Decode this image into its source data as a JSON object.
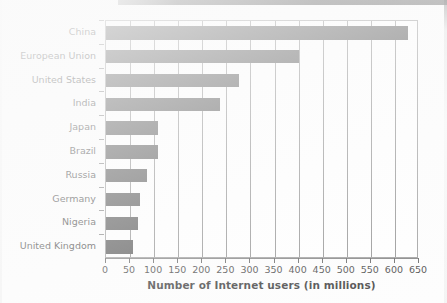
{
  "chart_data": {
    "type": "bar",
    "orientation": "horizontal",
    "title": "",
    "xlabel": "Number of Internet users (in millions)",
    "ylabel": "",
    "xlim": [
      0,
      650
    ],
    "xticks": [
      0,
      50,
      100,
      150,
      200,
      250,
      300,
      350,
      400,
      450,
      500,
      550,
      600,
      650
    ],
    "grid": true,
    "grid_axis": "x",
    "legend": false,
    "bar_color": "#3a3a3a",
    "categories": [
      "China",
      "European Union",
      "United States",
      "India",
      "Japan",
      "Brazil",
      "Russia",
      "Germany",
      "Nigeria",
      "United Kingdom"
    ],
    "values": [
      628,
      400,
      277,
      237,
      109,
      108,
      85,
      70,
      67,
      57
    ]
  }
}
